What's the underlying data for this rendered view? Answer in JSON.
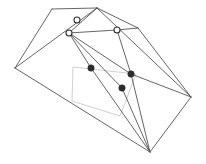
{
  "figure": {
    "canvas": {
      "width": 206,
      "height": 164,
      "background": "#ffffff"
    },
    "colors": {
      "wireframe_stroke": "#4a4a4a",
      "ghost_stroke": "#c9c9c9",
      "marker_open_fill": "#ffffff",
      "marker_open_stroke": "#2b2b2b",
      "marker_filled_fill": "#2b2b2b"
    },
    "vertices": {
      "apex_top": [
        97,
        8
      ],
      "upper_left": [
        52,
        9
      ],
      "left": [
        15,
        68
      ],
      "ridge_right": [
        138,
        28
      ],
      "right": [
        191,
        97
      ],
      "bottom": [
        150,
        152
      ],
      "inner_hub": [
        69,
        33
      ],
      "mid_left": [
        91,
        68
      ],
      "mid_right": [
        131,
        74
      ],
      "lower_mid": [
        122,
        88
      ],
      "ridge_mid": [
        117,
        30
      ],
      "near_apex": [
        77,
        20
      ]
    },
    "edges": [
      {
        "from": "upper_left",
        "to": "apex_top"
      },
      {
        "from": "upper_left",
        "to": "left"
      },
      {
        "from": "left",
        "to": "apex_top"
      },
      {
        "from": "left",
        "to": "bottom"
      },
      {
        "from": "apex_top",
        "to": "ridge_right"
      },
      {
        "from": "apex_top",
        "to": "right"
      },
      {
        "from": "ridge_right",
        "to": "right"
      },
      {
        "from": "right",
        "to": "bottom"
      },
      {
        "from": "apex_top",
        "to": "inner_hub"
      },
      {
        "from": "inner_hub",
        "to": "ridge_mid"
      },
      {
        "from": "ridge_mid",
        "to": "ridge_right"
      },
      {
        "from": "inner_hub",
        "to": "mid_left"
      },
      {
        "from": "mid_left",
        "to": "bottom"
      },
      {
        "from": "inner_hub",
        "to": "mid_right"
      },
      {
        "from": "mid_right",
        "to": "bottom"
      },
      {
        "from": "inner_hub",
        "to": "lower_mid"
      },
      {
        "from": "lower_mid",
        "to": "bottom"
      },
      {
        "from": "mid_right",
        "to": "right"
      },
      {
        "from": "ridge_mid",
        "to": "mid_right"
      }
    ],
    "ghost_quad": {
      "label": "light-gray overlay quadrilateral",
      "points": [
        [
          73,
          67
        ],
        [
          136,
          74
        ],
        [
          120,
          116
        ],
        [
          72,
          101
        ]
      ]
    },
    "markers": {
      "open_circles": {
        "label": "open circle markers",
        "radius": 3,
        "points": [
          [
            77,
            20
          ],
          [
            69,
            33
          ],
          [
            117,
            30
          ]
        ]
      },
      "filled_dots": {
        "label": "filled dot markers",
        "radius": 3.2,
        "points": [
          [
            91,
            68
          ],
          [
            131,
            74
          ],
          [
            122,
            88
          ]
        ]
      }
    }
  }
}
